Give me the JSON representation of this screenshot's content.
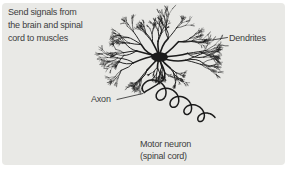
{
  "figure": {
    "description_lines": [
      "Send signals from",
      "the brain and spinal",
      "cord to muscles"
    ],
    "labels": {
      "dendrites": "Dendrites",
      "axon": "Axon"
    },
    "caption_lines": [
      "Motor neuron",
      "(spinal cord)"
    ],
    "colors": {
      "panel_bg": "#e9e9e6",
      "ink": "#1b1b1b",
      "text": "#3d3d3d"
    }
  }
}
